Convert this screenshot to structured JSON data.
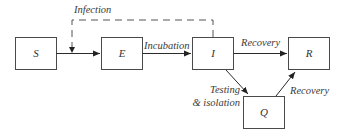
{
  "diagram": {
    "type": "compartmental-model-flowchart",
    "nodes": [
      {
        "id": "S",
        "label": "S"
      },
      {
        "id": "E",
        "label": "E"
      },
      {
        "id": "I",
        "label": "I"
      },
      {
        "id": "R",
        "label": "R"
      },
      {
        "id": "Q",
        "label": "Q"
      }
    ],
    "edges": [
      {
        "from": "S",
        "to": "E",
        "label": ""
      },
      {
        "from": "I",
        "to": "S-E",
        "label": "Infection",
        "style": "dashed"
      },
      {
        "from": "E",
        "to": "I",
        "label": "Incubation"
      },
      {
        "from": "I",
        "to": "R",
        "label": "Recovery"
      },
      {
        "from": "I",
        "to": "Q",
        "label_line1": "Testing",
        "label_line2": "& isolation"
      },
      {
        "from": "Q",
        "to": "R",
        "label": "Recovery"
      }
    ],
    "colors": {
      "stroke": "#4a4a4a",
      "text": "#333333",
      "background": "#ffffff"
    }
  }
}
